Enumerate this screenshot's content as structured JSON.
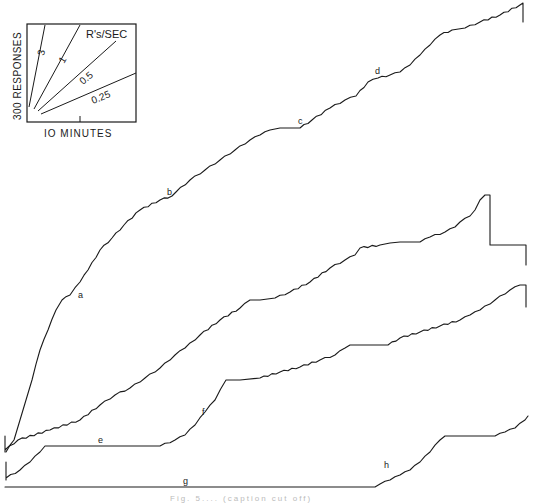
{
  "chart_data": {
    "type": "line",
    "title": "",
    "xlabel": "10 MINUTES",
    "ylabel": "300 RESPONSES",
    "legend": {
      "title": "R's/SEC",
      "rates": [
        "3",
        "1",
        "0.5",
        "0.25"
      ],
      "x_scale_label": "IO MINUTES",
      "y_scale_label": "300 RESPONSES"
    },
    "grid": false,
    "series": [
      {
        "name": "record-1",
        "annotations": [
          "a",
          "b",
          "c",
          "d"
        ],
        "points": [
          [
            6,
            452
          ],
          [
            14,
            440
          ],
          [
            20,
            420
          ],
          [
            26,
            400
          ],
          [
            32,
            380
          ],
          [
            40,
            350
          ],
          [
            48,
            330
          ],
          [
            56,
            310
          ],
          [
            62,
            300
          ],
          [
            70,
            295
          ],
          [
            80,
            282
          ],
          [
            88,
            270
          ],
          [
            100,
            250
          ],
          [
            112,
            238
          ],
          [
            124,
            225
          ],
          [
            140,
            210
          ],
          [
            160,
            200
          ],
          [
            172,
            196
          ],
          [
            176,
            192
          ],
          [
            190,
            180
          ],
          [
            205,
            170
          ],
          [
            220,
            160
          ],
          [
            235,
            150
          ],
          [
            250,
            140
          ],
          [
            260,
            135
          ],
          [
            270,
            130
          ],
          [
            280,
            128
          ],
          [
            300,
            128
          ],
          [
            312,
            120
          ],
          [
            330,
            108
          ],
          [
            345,
            100
          ],
          [
            356,
            96
          ],
          [
            368,
            82
          ],
          [
            378,
            78
          ],
          [
            390,
            75
          ],
          [
            400,
            72
          ],
          [
            410,
            65
          ],
          [
            420,
            55
          ],
          [
            430,
            45
          ],
          [
            440,
            35
          ],
          [
            452,
            30
          ],
          [
            465,
            28
          ],
          [
            480,
            22
          ],
          [
            500,
            15
          ],
          [
            520,
            5
          ],
          [
            523,
            3
          ],
          [
            523,
            22
          ]
        ]
      },
      {
        "name": "record-2",
        "annotations": [],
        "points": [
          [
            5,
            452
          ],
          [
            5,
            436
          ],
          [
            5,
            450
          ],
          [
            18,
            440
          ],
          [
            50,
            430
          ],
          [
            80,
            420
          ],
          [
            100,
            405
          ],
          [
            115,
            395
          ],
          [
            130,
            388
          ],
          [
            145,
            378
          ],
          [
            160,
            368
          ],
          [
            175,
            355
          ],
          [
            185,
            348
          ],
          [
            200,
            335
          ],
          [
            220,
            320
          ],
          [
            240,
            308
          ],
          [
            250,
            300
          ],
          [
            260,
            300
          ],
          [
            275,
            298
          ],
          [
            290,
            292
          ],
          [
            310,
            282
          ],
          [
            330,
            268
          ],
          [
            345,
            260
          ],
          [
            355,
            255
          ],
          [
            360,
            248
          ],
          [
            380,
            245
          ],
          [
            390,
            243
          ],
          [
            400,
            242
          ],
          [
            420,
            242
          ],
          [
            430,
            237
          ],
          [
            445,
            232
          ],
          [
            455,
            227
          ],
          [
            460,
            222
          ],
          [
            470,
            216
          ],
          [
            475,
            210
          ],
          [
            480,
            200
          ],
          [
            485,
            195
          ],
          [
            490,
            195
          ],
          [
            490,
            245
          ],
          [
            526,
            245
          ],
          [
            526,
            265
          ]
        ]
      },
      {
        "name": "record-3",
        "annotations": [
          "e",
          "f"
        ],
        "points": [
          [
            6,
            480
          ],
          [
            6,
            462
          ],
          [
            6,
            478
          ],
          [
            20,
            470
          ],
          [
            30,
            462
          ],
          [
            40,
            452
          ],
          [
            45,
            446
          ],
          [
            160,
            446
          ],
          [
            175,
            440
          ],
          [
            185,
            435
          ],
          [
            195,
            425
          ],
          [
            205,
            412
          ],
          [
            215,
            400
          ],
          [
            226,
            380
          ],
          [
            240,
            380
          ],
          [
            260,
            378
          ],
          [
            280,
            372
          ],
          [
            300,
            367
          ],
          [
            320,
            360
          ],
          [
            335,
            355
          ],
          [
            345,
            348
          ],
          [
            350,
            345
          ],
          [
            365,
            345
          ],
          [
            388,
            345
          ],
          [
            400,
            338
          ],
          [
            420,
            332
          ],
          [
            440,
            326
          ],
          [
            460,
            320
          ],
          [
            470,
            315
          ],
          [
            480,
            310
          ],
          [
            495,
            300
          ],
          [
            510,
            290
          ],
          [
            520,
            285
          ],
          [
            526,
            285
          ],
          [
            526,
            307
          ]
        ]
      },
      {
        "name": "record-4",
        "annotations": [
          "g",
          "h"
        ],
        "points": [
          [
            5,
            487
          ],
          [
            375,
            487
          ],
          [
            380,
            484
          ],
          [
            390,
            480
          ],
          [
            400,
            475
          ],
          [
            410,
            470
          ],
          [
            420,
            462
          ],
          [
            430,
            452
          ],
          [
            440,
            440
          ],
          [
            445,
            436
          ],
          [
            495,
            436
          ],
          [
            505,
            432
          ],
          [
            515,
            428
          ],
          [
            525,
            420
          ],
          [
            528,
            416
          ]
        ]
      }
    ],
    "segment_labels": [
      {
        "text": "a",
        "x": 78,
        "y": 298
      },
      {
        "text": "b",
        "x": 167,
        "y": 195
      },
      {
        "text": "c",
        "x": 298,
        "y": 124
      },
      {
        "text": "d",
        "x": 375,
        "y": 74
      },
      {
        "text": "e",
        "x": 98,
        "y": 443
      },
      {
        "text": "f",
        "x": 202,
        "y": 415
      },
      {
        "text": "g",
        "x": 183,
        "y": 484
      },
      {
        "text": "h",
        "x": 384,
        "y": 468
      }
    ]
  },
  "caption": "Fig. 5.... (caption cut off)"
}
